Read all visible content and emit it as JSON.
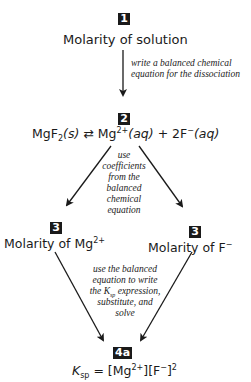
{
  "step1": {
    "badge": "1",
    "title": "Molarity of solution"
  },
  "arrow1": {
    "note_line1": "write a balanced chemical",
    "note_line2": "equation for the dissociation"
  },
  "step2": {
    "badge": "2",
    "equation": {
      "reactant": "MgF",
      "reactant_sub": "2",
      "reactant_state": "(s)",
      "equilibrium_symbol": "⇄",
      "product1": "Mg",
      "product1_charge": "2+",
      "product1_state": "(aq)",
      "plus": "+",
      "product2_coef": "2F",
      "product2_charge": "−",
      "product2_state": "(aq)"
    }
  },
  "arrow2": {
    "note_lines": [
      "use",
      "coefficients",
      "from the",
      "balanced",
      "chemical",
      "equation"
    ]
  },
  "step3_left": {
    "badge": "3",
    "title": "Molarity of Mg",
    "charge": "2+"
  },
  "step3_right": {
    "badge": "3",
    "title": "Molarity of F",
    "charge": "−"
  },
  "arrow3": {
    "note_line1": "use the balanced",
    "note_line2": "equation to write",
    "note_line3_pre": "the ",
    "note_line3_K": "K",
    "note_line3_sub": "sp",
    "note_line3_post": " expression,",
    "note_line4": "substitute, and",
    "note_line5": "solve"
  },
  "step4": {
    "badge": "4a",
    "ksp_K": "K",
    "ksp_sub": "sp",
    "equals": " = [Mg",
    "mg_charge": "2+",
    "mid": "][F",
    "f_charge": "−",
    "end": "]",
    "exponent": "2"
  },
  "colors": {
    "badge_bg": "#1a1a1a",
    "text": "#1a1a1a",
    "background": "#ffffff"
  }
}
